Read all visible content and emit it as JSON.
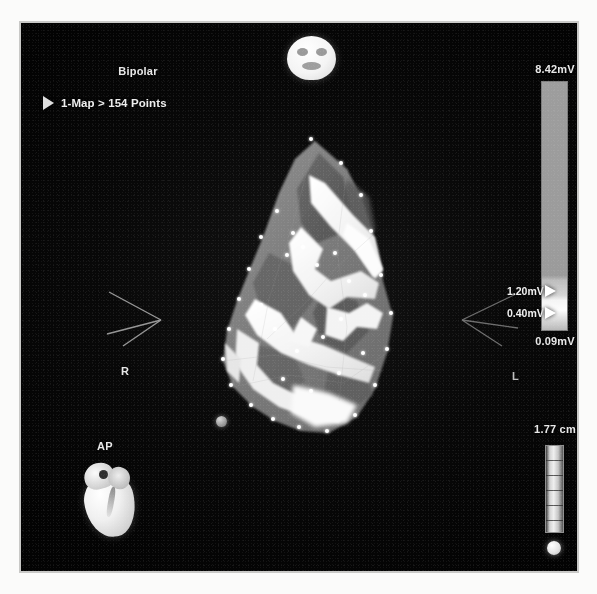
{
  "window": {
    "title": "Electroanatomic Voltage Map"
  },
  "overlay": {
    "map_type_label": "Bipolar",
    "map_tree_label": "1-Map > 154 Points",
    "expand_icon": "play-triangle-icon",
    "head_orientation_icon": "head-face-icon",
    "heart_orientation_icon": "heart-icon"
  },
  "orientation": {
    "anterior_posterior": "AP",
    "right": "R",
    "left": "L"
  },
  "voltage_scale": {
    "unit": "mV",
    "max_label": "8.42mV",
    "min_label": "0.09mV",
    "upper_threshold_label": "1.20mV",
    "lower_threshold_label": "0.40mV",
    "max_value": 8.42,
    "min_value": 0.09,
    "upper_threshold": 1.2,
    "lower_threshold": 0.4,
    "high_color": "#9d9d9d",
    "low_color": "#fdfdfd",
    "marker_color": "#ffffff"
  },
  "size_gauge": {
    "value_label": "1.77 cm",
    "value": 1.77,
    "unit": "cm",
    "tick_count": 5,
    "knob_icon": "slider-knob-icon"
  },
  "map": {
    "point_count": 154,
    "catheter_tip_icon": "catheter-tip-marker"
  }
}
